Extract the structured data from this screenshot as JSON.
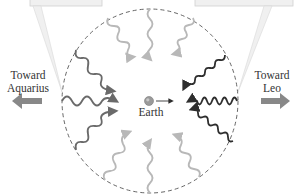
{
  "diagram": {
    "center_label": "Earth",
    "left_direction_label": "Toward Aquarius",
    "left_direction_line1": "Toward",
    "left_direction_line2": "Aquarius",
    "right_direction_label": "Toward Leo",
    "right_direction_line1": "Toward",
    "right_direction_line2": "Leo",
    "colors": {
      "circle_dashed": "#555555",
      "wave_dark_redshift_side": "#6a6a6a",
      "wave_dark_blueshift_side": "#2e2e2e",
      "wave_light": "#b8b8b8",
      "arrow_fill": "#888888",
      "callout_fill": "#f0f0f0",
      "callout_border": "#d0d0d0",
      "earth": "#9a9a9a"
    },
    "waves": [
      {
        "from": "top",
        "shade": "light",
        "wavelength": "medium"
      },
      {
        "from": "top-left",
        "shade": "light",
        "wavelength": "long"
      },
      {
        "from": "top-right",
        "shade": "light",
        "wavelength": "medium"
      },
      {
        "from": "upper-left",
        "shade": "dark",
        "wavelength": "long"
      },
      {
        "from": "upper-right",
        "shade": "darkest",
        "wavelength": "short"
      },
      {
        "from": "left",
        "shade": "dark",
        "wavelength": "long"
      },
      {
        "from": "right",
        "shade": "darkest",
        "wavelength": "short"
      },
      {
        "from": "lower-left",
        "shade": "dark",
        "wavelength": "long"
      },
      {
        "from": "lower-right",
        "shade": "darkest",
        "wavelength": "short"
      },
      {
        "from": "bottom-left",
        "shade": "light",
        "wavelength": "long"
      },
      {
        "from": "bottom",
        "shade": "light",
        "wavelength": "medium"
      },
      {
        "from": "bottom-right",
        "shade": "light",
        "wavelength": "medium"
      }
    ]
  }
}
